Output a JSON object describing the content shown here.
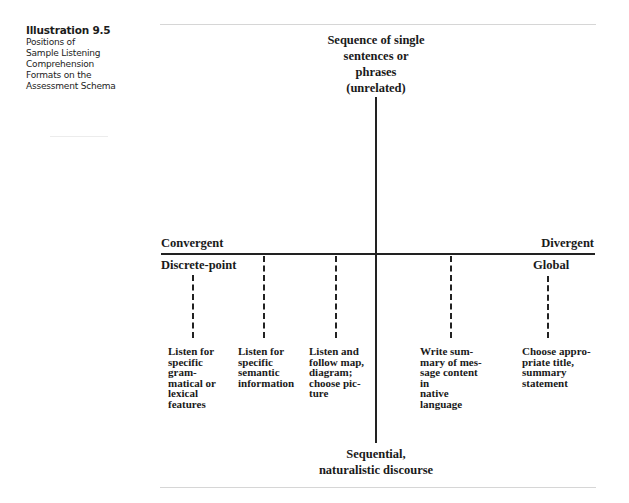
{
  "caption": {
    "title": "Illustration 9.5",
    "subtitle_lines": [
      "Positions of",
      "Sample Listening",
      "Comprehension",
      "Formats on the",
      "Assessment Schema"
    ]
  },
  "diagram": {
    "vertical_axis": {
      "top_label": "Sequence of single\nsentences or\nphrases\n(unrelated)",
      "bottom_label": "Sequential,\nnaturalistic discourse"
    },
    "horizontal_axis": {
      "left_above": "Convergent",
      "left_below": "Discrete-point",
      "right_above": "Divergent",
      "right_below": "Global"
    },
    "formats": [
      {
        "label": "Listen for\nspecific\ngram-\nmatical or\nlexical\nfeatures",
        "x": 193
      },
      {
        "label": "Listen for\nspecific\nsemantic\ninformation",
        "x": 264
      },
      {
        "label": "Listen and\nfollow map,\ndiagram;\nchoose pic-\nture",
        "x": 336
      },
      {
        "label": "Write sum-\nmary of mes-\nsage content\nin\nnative\nlanguage",
        "x": 451
      },
      {
        "label": "Choose appro-\npriate title,\nsummary\nstatement",
        "x": 548
      }
    ]
  },
  "colors": {
    "ink": "#1a1a1a",
    "frame_rule": "#d6d6d6",
    "background": "#ffffff"
  }
}
